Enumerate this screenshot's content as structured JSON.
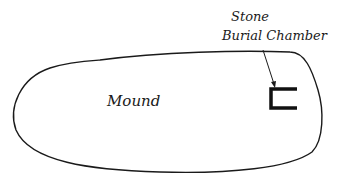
{
  "diagram": {
    "labels": {
      "mound": "Mound",
      "chamber_line1": "Stone",
      "chamber_line2": "Burial Chamber"
    },
    "colors": {
      "stroke": "#1a1a1a",
      "background": "#ffffff"
    }
  }
}
